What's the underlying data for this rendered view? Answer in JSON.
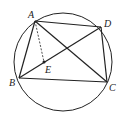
{
  "diagram": {
    "type": "circle-with-inscribed-quadrilateral",
    "circle": {
      "cx": 63,
      "cy": 62,
      "r": 49
    },
    "points": {
      "A": {
        "x": 35,
        "y": 21,
        "label": "A"
      },
      "B": {
        "x": 19,
        "y": 78,
        "label": "B"
      },
      "C": {
        "x": 107,
        "y": 82,
        "label": "C"
      },
      "D": {
        "x": 101,
        "y": 27,
        "label": "D"
      },
      "E": {
        "x": 44,
        "y": 62,
        "label": "E"
      }
    },
    "segments_solid": [
      "AB",
      "BC",
      "CD",
      "DA",
      "AC",
      "BD"
    ],
    "segments_dashed": [
      "AE"
    ],
    "stroke_color": "#222222"
  }
}
